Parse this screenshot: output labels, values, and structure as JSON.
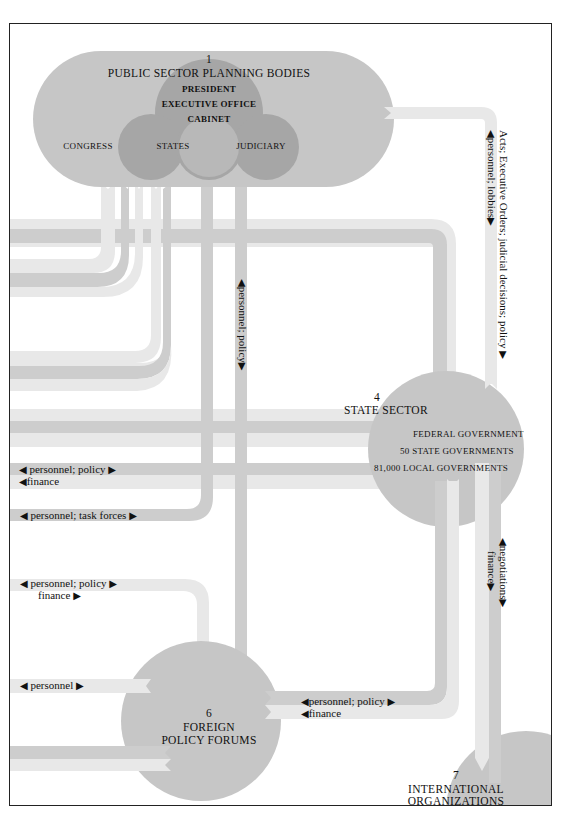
{
  "colors": {
    "frame": "#222222",
    "blob": "#c6c6c6",
    "circle": "#a6a6a6",
    "bar_light": "#e8e8e8",
    "bar_mid": "#cdcdcd",
    "text": "#111111"
  },
  "nodes": {
    "public_sector": {
      "number": "1",
      "title": "PUBLIC SECTOR PLANNING BODIES",
      "lines": [
        "PRESIDENT",
        "EXECUTIVE OFFICE",
        "CABINET"
      ],
      "circles": [
        "CONGRESS",
        "STATES",
        "JUDICIARY"
      ]
    },
    "state_sector": {
      "number": "4",
      "title": "STATE SECTOR",
      "lines": [
        "FEDERAL GOVERNMENT",
        "50 STATE GOVERNMENTS",
        "81,000 LOCAL GOVERNMENTS"
      ]
    },
    "foreign_policy": {
      "number": "6",
      "title_line1": "FOREIGN",
      "title_line2": "POLICY FORUMS"
    },
    "international": {
      "number": "7",
      "title_line1": "INTERNATIONAL",
      "title_line2": "ORGANIZATIONS"
    }
  },
  "flows": {
    "public_to_state_right": {
      "line1": "Acts; Executive Orders; judicial decisions; policy",
      "line2": "personnel; lobbies"
    },
    "public_to_foreign_vertical": {
      "line1": "personnel; policy"
    },
    "left_state_1": {
      "line1": "personnel; policy",
      "line2": "finance"
    },
    "left_task_forces": {
      "line1": "personnel; task forces"
    },
    "left_foreign_1": {
      "line1": "personnel; policy",
      "line2": "finance"
    },
    "left_foreign_2": {
      "line1": "personnel"
    },
    "state_foreign": {
      "line1": "personnel; policy",
      "line2": "finance"
    },
    "state_international": {
      "line1": "negotiations",
      "line2": "finance"
    }
  },
  "arrows": {
    "left": "◀",
    "right": "▶",
    "up": "▲",
    "down": "▼"
  }
}
